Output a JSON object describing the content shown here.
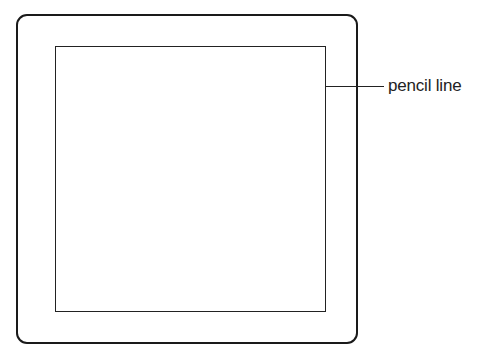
{
  "diagram": {
    "annotation_label": "pencil line",
    "shapes": [
      {
        "name": "outer-frame",
        "type": "rounded-rectangle"
      },
      {
        "name": "inner-square",
        "type": "rectangle"
      }
    ],
    "colors": {
      "line": "#222222",
      "background": "#ffffff"
    }
  }
}
